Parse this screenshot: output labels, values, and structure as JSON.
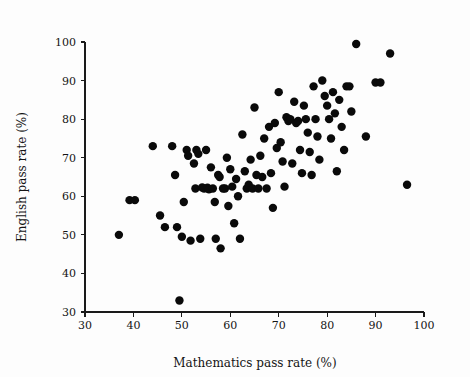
{
  "chart_data": {
    "type": "scatter",
    "title": "",
    "xlabel": "Mathematics pass rate (%)",
    "ylabel": "English pass rate (%)",
    "xlim": [
      30,
      100
    ],
    "ylim": [
      30,
      100
    ],
    "xticks": [
      30,
      40,
      50,
      60,
      70,
      80,
      90,
      100
    ],
    "yticks": [
      30,
      40,
      50,
      60,
      70,
      80,
      90,
      100
    ],
    "grid": false,
    "legend": null,
    "marker": {
      "shape": "circle",
      "color": "#0a0a0a",
      "size": 4.2
    },
    "series": [
      {
        "name": "schools",
        "points": [
          [
            37.0,
            50.0
          ],
          [
            39.2,
            59.0
          ],
          [
            40.3,
            59.0
          ],
          [
            44.0,
            73.0
          ],
          [
            45.5,
            55.0
          ],
          [
            46.5,
            52.0
          ],
          [
            48.0,
            73.0
          ],
          [
            48.6,
            65.5
          ],
          [
            49.0,
            52.0
          ],
          [
            49.5,
            33.0
          ],
          [
            50.0,
            49.5
          ],
          [
            50.4,
            58.5
          ],
          [
            51.0,
            72.0
          ],
          [
            51.3,
            70.5
          ],
          [
            51.8,
            48.5
          ],
          [
            52.5,
            68.5
          ],
          [
            52.8,
            62.0
          ],
          [
            53.0,
            72.0
          ],
          [
            53.4,
            71.0
          ],
          [
            53.8,
            49.0
          ],
          [
            54.2,
            62.3
          ],
          [
            54.6,
            62.0
          ],
          [
            55.0,
            72.0
          ],
          [
            55.3,
            62.2
          ],
          [
            55.6,
            61.8
          ],
          [
            56.0,
            67.5
          ],
          [
            56.4,
            62.0
          ],
          [
            56.8,
            58.5
          ],
          [
            57.0,
            49.0
          ],
          [
            57.5,
            65.5
          ],
          [
            57.8,
            65.0
          ],
          [
            58.0,
            46.5
          ],
          [
            58.5,
            62.0
          ],
          [
            58.9,
            62.0
          ],
          [
            59.3,
            70.0
          ],
          [
            59.6,
            57.5
          ],
          [
            60.0,
            67.0
          ],
          [
            60.4,
            62.5
          ],
          [
            60.8,
            53.0
          ],
          [
            61.2,
            64.5
          ],
          [
            61.6,
            60.0
          ],
          [
            62.0,
            49.0
          ],
          [
            62.5,
            76.0
          ],
          [
            63.0,
            66.5
          ],
          [
            63.4,
            62.0
          ],
          [
            63.8,
            63.0
          ],
          [
            64.2,
            69.5
          ],
          [
            64.6,
            62.0
          ],
          [
            65.0,
            83.0
          ],
          [
            65.4,
            65.5
          ],
          [
            65.8,
            62.0
          ],
          [
            66.2,
            70.5
          ],
          [
            66.6,
            65.0
          ],
          [
            67.0,
            75.0
          ],
          [
            67.5,
            62.0
          ],
          [
            68.0,
            78.0
          ],
          [
            68.4,
            66.0
          ],
          [
            68.8,
            57.0
          ],
          [
            69.2,
            79.0
          ],
          [
            69.6,
            72.5
          ],
          [
            70.0,
            87.0
          ],
          [
            70.4,
            74.0
          ],
          [
            70.8,
            69.0
          ],
          [
            71.2,
            62.5
          ],
          [
            71.6,
            80.5
          ],
          [
            72.0,
            79.5
          ],
          [
            72.4,
            80.0
          ],
          [
            72.8,
            68.5
          ],
          [
            73.2,
            84.5
          ],
          [
            73.6,
            79.0
          ],
          [
            74.0,
            79.5
          ],
          [
            74.4,
            72.0
          ],
          [
            74.8,
            66.0
          ],
          [
            75.2,
            83.5
          ],
          [
            75.6,
            80.0
          ],
          [
            76.0,
            76.5
          ],
          [
            76.4,
            71.5
          ],
          [
            76.8,
            65.5
          ],
          [
            77.2,
            88.5
          ],
          [
            77.6,
            80.0
          ],
          [
            78.0,
            75.5
          ],
          [
            78.4,
            69.5
          ],
          [
            79.0,
            90.0
          ],
          [
            79.5,
            86.0
          ],
          [
            80.0,
            83.5
          ],
          [
            80.4,
            80.0
          ],
          [
            80.8,
            75.0
          ],
          [
            81.2,
            87.0
          ],
          [
            81.6,
            81.5
          ],
          [
            82.0,
            66.5
          ],
          [
            82.5,
            85.0
          ],
          [
            83.0,
            78.0
          ],
          [
            83.5,
            72.0
          ],
          [
            84.0,
            88.5
          ],
          [
            84.6,
            88.5
          ],
          [
            85.0,
            82.0
          ],
          [
            86.0,
            99.5
          ],
          [
            88.0,
            75.5
          ],
          [
            90.0,
            89.5
          ],
          [
            91.0,
            89.5
          ],
          [
            93.0,
            97.0
          ],
          [
            96.5,
            63.0
          ]
        ]
      }
    ]
  },
  "axes": {
    "x_title": "Mathematics pass rate (%)",
    "y_title": "English pass rate (%)",
    "x_tick_labels": [
      "30",
      "40",
      "50",
      "60",
      "70",
      "80",
      "90",
      "100"
    ],
    "y_tick_labels": [
      "30",
      "40",
      "50",
      "60",
      "70",
      "80",
      "90",
      "100"
    ]
  },
  "colors": {
    "background": "#fdfdfd",
    "axis": "#1a1a1a",
    "marker": "#0a0a0a",
    "text": "#141414"
  }
}
